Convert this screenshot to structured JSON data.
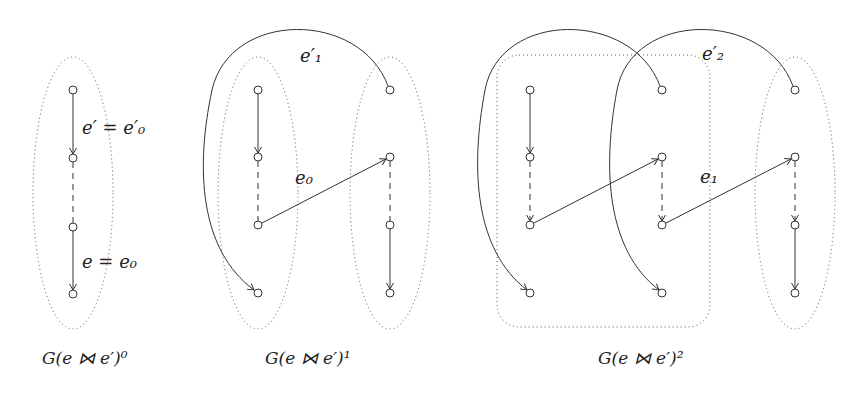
{
  "figure": {
    "panels": [
      {
        "caption": "G(e ⋈ e′)⁰",
        "labels": {
          "top_edge": "e′ = e′₀",
          "bottom_edge": "e = e₀"
        }
      },
      {
        "caption": "G(e ⋈ e′)¹",
        "labels": {
          "arc_edge": "e′₁",
          "cross_edge": "e₀"
        }
      },
      {
        "caption": "G(e ⋈ e′)²",
        "labels": {
          "arc_edge": "e′₂",
          "cross_edge": "e₁"
        }
      }
    ],
    "colors": {
      "stroke": "#333333",
      "background": "#ffffff"
    }
  }
}
